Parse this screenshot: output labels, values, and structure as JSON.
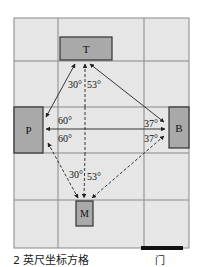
{
  "diagram": {
    "caption": "2 英尺坐标方格",
    "door_label": "门",
    "grid": {
      "x_lines": [
        14,
        58,
        144,
        189
      ],
      "y_lines": [
        18,
        61,
        107,
        153,
        200,
        248
      ],
      "fill": "#e6e6e6",
      "line_color": "#888888"
    },
    "boxes": [
      {
        "id": "T",
        "label": "T",
        "x": 60,
        "y": 37,
        "w": 52,
        "h": 23
      },
      {
        "id": "P",
        "label": "P",
        "x": 14,
        "y": 107,
        "w": 29,
        "h": 46
      },
      {
        "id": "B",
        "label": "B",
        "x": 169,
        "y": 107,
        "w": 20,
        "h": 41
      },
      {
        "id": "M",
        "label": "M",
        "x": 76,
        "y": 201,
        "w": 17,
        "h": 25
      }
    ],
    "box_fill": "#a9a9a9",
    "angles": {
      "T_left": "30°",
      "T_right": "53°",
      "P_top": "60°",
      "P_bottom": "60°",
      "B_top": "37°",
      "B_bottom": "37°",
      "M_left": "30°",
      "M_right": "53°"
    },
    "door": {
      "x": 141,
      "y": 246,
      "w": 42,
      "h": 4,
      "color": "#111111"
    }
  }
}
